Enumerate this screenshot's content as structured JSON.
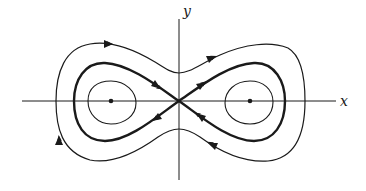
{
  "diagram": {
    "type": "phase-portrait",
    "axes": {
      "x_label": "x",
      "y_label": "y"
    },
    "equilibria": [
      {
        "kind": "saddle",
        "position": "origin"
      },
      {
        "kind": "center",
        "position": "left, on x-axis"
      },
      {
        "kind": "center",
        "position": "right, on x-axis"
      }
    ],
    "curves": [
      {
        "name": "inner-orbit-left",
        "style": "thin",
        "arrows": 0
      },
      {
        "name": "inner-orbit-right",
        "style": "thin",
        "arrows": 0
      },
      {
        "name": "separatrix-figure-eight",
        "style": "thick",
        "arrows": 4
      },
      {
        "name": "outer-orbit",
        "style": "thin",
        "arrows": 4
      }
    ],
    "colors": {
      "ink": "#1a1a1a",
      "background": "#ffffff"
    }
  }
}
